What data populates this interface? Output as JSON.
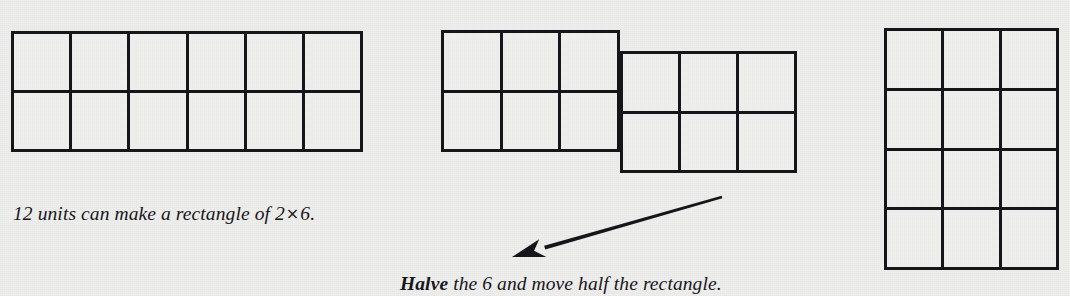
{
  "page": {
    "background_color": "#ededec",
    "ink_color": "#16161a",
    "width": 1070,
    "height": 296
  },
  "figures": {
    "rectangle_2x6": {
      "name": "2 by 6 rectangle",
      "rows": 2,
      "cols": 6,
      "total_units": 12,
      "x": 11,
      "y": 31,
      "width": 352,
      "height": 121
    },
    "split_left_half": {
      "name": "left half 2 by 3",
      "rows": 2,
      "cols": 3,
      "total_units": 6,
      "x": 441,
      "y": 30,
      "width": 179,
      "height": 122
    },
    "split_right_half": {
      "name": "moved half 2 by 3",
      "rows": 2,
      "cols": 3,
      "total_units": 6,
      "x": 620,
      "y": 51,
      "width": 177,
      "height": 122
    },
    "rectangle_4x3": {
      "name": "4 by 3 rectangle",
      "rows": 4,
      "cols": 3,
      "total_units": 12,
      "x": 884,
      "y": 28,
      "width": 175,
      "height": 242
    }
  },
  "captions": {
    "first": {
      "full_text": "12 units can make a rectangle of 2 × 6.",
      "part_before_symbol": "12 units can make a rectangle of 2",
      "symbol": "×",
      "part_after_symbol": "6.",
      "x": 13,
      "y": 203
    },
    "second": {
      "lead_word": "Halve",
      "rest_text": " the 6 and move half the rectangle.",
      "full_text": "Halve the 6 and move half the rectangle.",
      "x": 400,
      "y": 273
    }
  },
  "arrow": {
    "name": "move-direction-arrow",
    "from_x": 722,
    "from_y": 197,
    "to_x": 512,
    "to_y": 257,
    "color": "#16161a",
    "thickness": 4
  }
}
